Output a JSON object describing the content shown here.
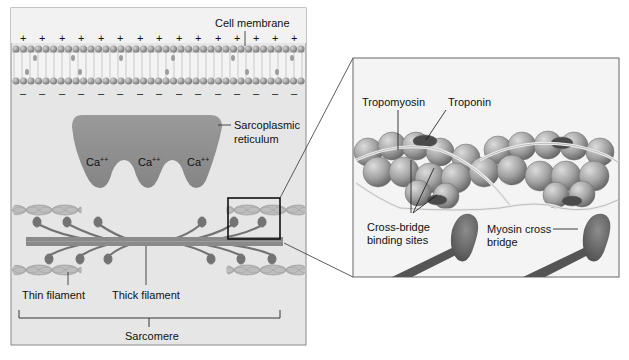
{
  "figure": {
    "type": "anatomy-diagram"
  },
  "left_panel": {
    "membrane_label": "Cell membrane",
    "outside_charge": "+",
    "inside_charge": "–",
    "sr_label_line1": "Sarcoplasmic",
    "sr_label_line2": "reticulum",
    "calcium": [
      "Ca++",
      "Ca++",
      "Ca++"
    ],
    "calcium_base": "Ca",
    "calcium_sup": "++",
    "thin_filament_label": "Thin filament",
    "thick_filament_label": "Thick filament",
    "sarcomere_label": "Sarcomere"
  },
  "right_panel": {
    "tropomyosin_label": "Tropomyosin",
    "troponin_label": "Troponin",
    "binding_sites_line1": "Cross-bridge",
    "binding_sites_line2": "binding sites",
    "myosin_line1": "Myosin cross",
    "myosin_line2": "bridge"
  },
  "colors": {
    "panel_bg": "#e6e6e6",
    "zoom_bg": "#f4f4f4",
    "sr_fill": "#8e8e8e",
    "thick_filament": "#8a8a8a",
    "myosin_head": "#6e6e6e",
    "actin_sphere": "#a8a8a8",
    "troponin": "#4a4a4a",
    "frame": "#555555"
  }
}
